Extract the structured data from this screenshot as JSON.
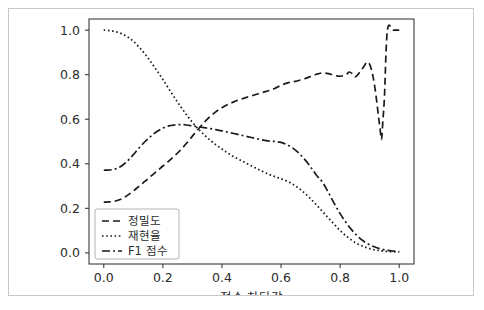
{
  "chart_data": {
    "type": "line",
    "title": "",
    "xlabel": "점수 차단값",
    "ylabel": "",
    "xlim": [
      -0.05,
      1.05
    ],
    "ylim": [
      -0.05,
      1.05
    ],
    "grid": false,
    "legend_position": "lower left",
    "xticks": [
      "0.0",
      "0.2",
      "0.4",
      "0.6",
      "0.8",
      "1.0"
    ],
    "xtick_values": [
      0.0,
      0.2,
      0.4,
      0.6,
      0.8,
      1.0
    ],
    "yticks": [
      "0.0",
      "0.2",
      "0.4",
      "0.6",
      "0.8",
      "1.0"
    ],
    "ytick_values": [
      0.0,
      0.2,
      0.4,
      0.6,
      0.8,
      1.0
    ],
    "series": [
      {
        "name": "정밀도",
        "style": "dashed",
        "dasharray": "7,4",
        "color": "#1a1a1a",
        "x": [
          0.0,
          0.02,
          0.04,
          0.06,
          0.08,
          0.1,
          0.12,
          0.14,
          0.16,
          0.18,
          0.2,
          0.22,
          0.24,
          0.26,
          0.28,
          0.3,
          0.32,
          0.34,
          0.36,
          0.38,
          0.4,
          0.42,
          0.44,
          0.46,
          0.48,
          0.5,
          0.52,
          0.54,
          0.56,
          0.58,
          0.6,
          0.62,
          0.64,
          0.66,
          0.68,
          0.7,
          0.72,
          0.74,
          0.76,
          0.78,
          0.8,
          0.82,
          0.83,
          0.84,
          0.85,
          0.86,
          0.87,
          0.88,
          0.89,
          0.9,
          0.91,
          0.92,
          0.93,
          0.935,
          0.94,
          0.945,
          0.95,
          0.96,
          0.98,
          1.0
        ],
        "y": [
          0.228,
          0.229,
          0.233,
          0.242,
          0.258,
          0.278,
          0.3,
          0.322,
          0.345,
          0.367,
          0.39,
          0.412,
          0.436,
          0.462,
          0.492,
          0.524,
          0.556,
          0.586,
          0.612,
          0.634,
          0.652,
          0.666,
          0.678,
          0.688,
          0.697,
          0.705,
          0.713,
          0.721,
          0.729,
          0.739,
          0.752,
          0.762,
          0.768,
          0.774,
          0.782,
          0.792,
          0.802,
          0.808,
          0.805,
          0.797,
          0.793,
          0.8,
          0.812,
          0.806,
          0.79,
          0.8,
          0.818,
          0.836,
          0.855,
          0.846,
          0.8,
          0.72,
          0.61,
          0.56,
          0.51,
          0.6,
          0.7,
          1.0,
          1.0,
          1.0
        ]
      },
      {
        "name": "재현율",
        "style": "dotted",
        "dasharray": "1.6,2.6",
        "color": "#1a1a1a",
        "x": [
          0.0,
          0.02,
          0.04,
          0.06,
          0.08,
          0.1,
          0.12,
          0.14,
          0.16,
          0.18,
          0.2,
          0.22,
          0.24,
          0.26,
          0.28,
          0.3,
          0.32,
          0.34,
          0.36,
          0.38,
          0.4,
          0.42,
          0.44,
          0.46,
          0.48,
          0.5,
          0.52,
          0.54,
          0.56,
          0.58,
          0.6,
          0.62,
          0.64,
          0.66,
          0.68,
          0.7,
          0.72,
          0.74,
          0.76,
          0.78,
          0.8,
          0.82,
          0.84,
          0.86,
          0.88,
          0.9,
          0.92,
          0.94,
          0.96,
          0.98,
          1.0
        ],
        "y": [
          1.0,
          0.998,
          0.993,
          0.984,
          0.97,
          0.95,
          0.923,
          0.892,
          0.856,
          0.818,
          0.778,
          0.737,
          0.696,
          0.657,
          0.62,
          0.586,
          0.556,
          0.53,
          0.506,
          0.485,
          0.466,
          0.448,
          0.432,
          0.418,
          0.404,
          0.39,
          0.377,
          0.364,
          0.352,
          0.342,
          0.333,
          0.322,
          0.308,
          0.29,
          0.268,
          0.243,
          0.215,
          0.186,
          0.157,
          0.128,
          0.1,
          0.076,
          0.056,
          0.04,
          0.028,
          0.019,
          0.013,
          0.009,
          0.006,
          0.005,
          0.004
        ]
      },
      {
        "name": "F1 점수",
        "style": "dashdot",
        "dasharray": "8,3,2,3",
        "color": "#1a1a1a",
        "x": [
          0.0,
          0.02,
          0.04,
          0.06,
          0.08,
          0.1,
          0.12,
          0.14,
          0.16,
          0.18,
          0.2,
          0.22,
          0.24,
          0.26,
          0.28,
          0.3,
          0.32,
          0.34,
          0.36,
          0.38,
          0.4,
          0.42,
          0.44,
          0.46,
          0.48,
          0.5,
          0.52,
          0.54,
          0.56,
          0.58,
          0.6,
          0.62,
          0.64,
          0.66,
          0.68,
          0.7,
          0.72,
          0.74,
          0.76,
          0.78,
          0.8,
          0.82,
          0.84,
          0.86,
          0.88,
          0.9,
          0.92,
          0.94,
          0.96,
          0.98,
          1.0
        ],
        "y": [
          0.371,
          0.372,
          0.377,
          0.39,
          0.412,
          0.441,
          0.472,
          0.5,
          0.524,
          0.545,
          0.56,
          0.57,
          0.574,
          0.576,
          0.574,
          0.57,
          0.566,
          0.562,
          0.558,
          0.553,
          0.548,
          0.542,
          0.536,
          0.53,
          0.524,
          0.518,
          0.512,
          0.506,
          0.502,
          0.5,
          0.496,
          0.486,
          0.47,
          0.448,
          0.42,
          0.386,
          0.348,
          0.318,
          0.272,
          0.222,
          0.176,
          0.136,
          0.102,
          0.074,
          0.052,
          0.036,
          0.025,
          0.017,
          0.011,
          0.008,
          0.006
        ]
      }
    ]
  },
  "legend": {
    "items": [
      {
        "label": "정밀도"
      },
      {
        "label": "재현율"
      },
      {
        "label": "F1 점수"
      }
    ]
  },
  "axis": {
    "xlabel": "점수 차단값"
  }
}
